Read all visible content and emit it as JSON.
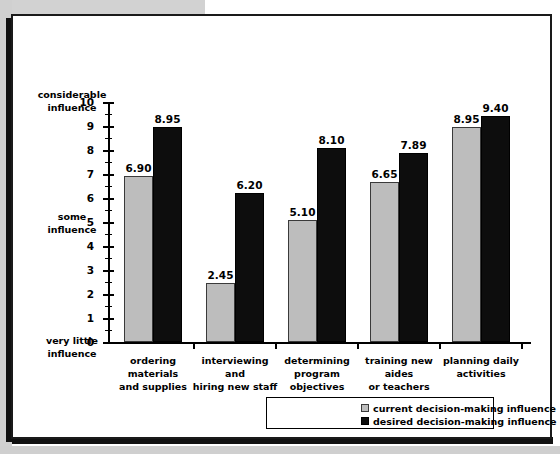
{
  "chart_data": {
    "type": "bar",
    "title": "",
    "xlabel": "",
    "ylabel": "",
    "ylim": [
      0,
      10
    ],
    "ytick_step": 1,
    "yminor_step": 0.5,
    "grid": false,
    "legend_position": "bottom-right",
    "categories": [
      "ordering materials and supplies",
      "interviewing and hiring new staff",
      "determining program objectives",
      "training new aides or teachers",
      "planning daily activities"
    ],
    "category_lines": [
      [
        "ordering materials",
        "and supplies"
      ],
      [
        "interviewing and",
        "hiring new staff"
      ],
      [
        "determining program",
        "objectives"
      ],
      [
        "training new aides",
        "or teachers"
      ],
      [
        "planning daily",
        "activities"
      ]
    ],
    "series": [
      {
        "name": "current decision-making influence",
        "color": "#bdbdbd",
        "values": [
          6.9,
          2.45,
          5.1,
          6.65,
          8.95
        ],
        "labels": [
          "6.90",
          "2.45",
          "5.10",
          "6.65",
          "8.95"
        ]
      },
      {
        "name": "desired decision-making influence",
        "color": "#0d0d0d",
        "values": [
          8.95,
          6.2,
          8.1,
          7.89,
          9.4
        ],
        "labels": [
          "8.95",
          "6.20",
          "8.10",
          "7.89",
          "9.40"
        ]
      }
    ],
    "ytick_labels": [
      "10",
      "9",
      "8",
      "7",
      "6",
      "5",
      "4",
      "3",
      "2",
      "1",
      "0"
    ],
    "y_anchor_labels": {
      "top": [
        "considerable",
        "influence"
      ],
      "middle": [
        "some",
        "influence"
      ],
      "bottom": [
        "very little",
        "influence"
      ]
    }
  },
  "legend": {
    "entries": [
      "current decision-making influence",
      "desired decision-making influence"
    ]
  }
}
